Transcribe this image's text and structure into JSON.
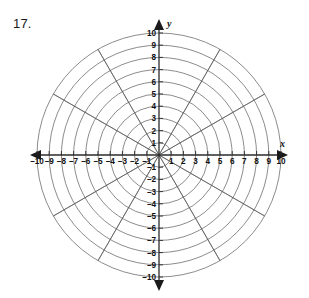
{
  "problem": {
    "number": "17."
  },
  "chart_data": {
    "type": "polar-grid",
    "title": "",
    "xlabel": "x",
    "ylabel": "y",
    "grid": true,
    "center_px": [
      159,
      155
    ],
    "px_per_unit": 12.2,
    "radial": {
      "max": 10,
      "step": 1,
      "circles": [
        1,
        2,
        3,
        4,
        5,
        6,
        7,
        8,
        9,
        10
      ]
    },
    "angular": {
      "step_degrees": 30,
      "spokes_degrees": [
        0,
        30,
        60,
        90,
        120,
        150,
        180,
        210,
        240,
        270,
        300,
        330
      ]
    },
    "x_axis": {
      "label": "x",
      "min": -10,
      "max": 10,
      "step": 1,
      "arrows": [
        "left",
        "right"
      ],
      "tick_labels": [
        "-10",
        "-9",
        "-8",
        "-7",
        "-6",
        "-5",
        "-4",
        "-3",
        "-2",
        "-1",
        "1",
        "2",
        "3",
        "4",
        "5",
        "6",
        "7",
        "8",
        "9",
        "10"
      ]
    },
    "y_axis": {
      "label": "y",
      "min": -10,
      "max": 10,
      "step": 1,
      "arrows": [
        "up",
        "down"
      ],
      "tick_labels": [
        "10",
        "9",
        "8",
        "7",
        "6",
        "5",
        "4",
        "3",
        "2",
        "1",
        "-1",
        "-2",
        "-3",
        "-4",
        "-5",
        "-6",
        "-7",
        "-8",
        "-9",
        "-10"
      ]
    },
    "series": [],
    "colors": {
      "background": "#ffffff",
      "grid_line": "#5a5a5a",
      "axis_line": "#2b2b2b",
      "text": "#111111"
    }
  }
}
